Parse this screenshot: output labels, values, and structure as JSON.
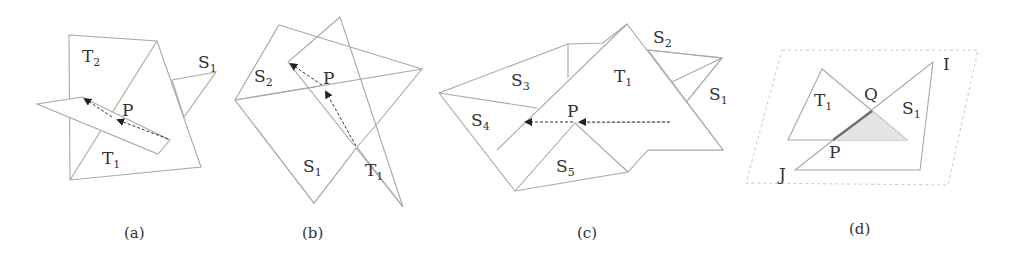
{
  "figure": {
    "panels": [
      {
        "id": "a",
        "caption": "(a)",
        "labels": {
          "t2": "T",
          "t2_sub": "2",
          "s1": "S",
          "s1_sub": "1",
          "p": "P",
          "t1": "T",
          "t1_sub": "1"
        }
      },
      {
        "id": "b",
        "caption": "(b)",
        "labels": {
          "s2": "S",
          "s2_sub": "2",
          "p": "P",
          "s1": "S",
          "s1_sub": "1",
          "t1": "T",
          "t1_sub": "1"
        }
      },
      {
        "id": "c",
        "caption": "(c)",
        "labels": {
          "s2": "S",
          "s2_sub": "2",
          "s3": "S",
          "s3_sub": "3",
          "t1": "T",
          "t1_sub": "1",
          "s1": "S",
          "s1_sub": "1",
          "s4": "S",
          "s4_sub": "4",
          "p": "P",
          "s5": "S",
          "s5_sub": "5"
        }
      },
      {
        "id": "d",
        "caption": "(d)",
        "labels": {
          "i": "I",
          "t1": "T",
          "t1_sub": "1",
          "q": "Q",
          "s1": "S",
          "s1_sub": "1",
          "p": "P",
          "j": "J"
        }
      }
    ],
    "colors": {
      "edge": "#a8a8a8",
      "arrow": "#333333",
      "highlight": "#707070",
      "shade": "#e4e4e4"
    }
  }
}
